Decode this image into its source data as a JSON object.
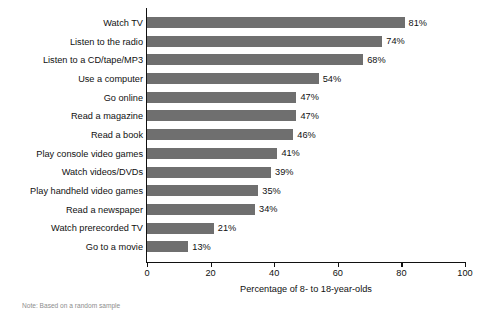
{
  "chart_data": {
    "type": "bar",
    "orientation": "horizontal",
    "title": "",
    "xlabel": "Percentage of 8- to 18-year-olds",
    "ylabel": "",
    "xlim": [
      0,
      100
    ],
    "xticks": [
      0,
      20,
      40,
      60,
      80,
      100
    ],
    "grid": false,
    "legend": null,
    "bar_color": "#6f6f6f",
    "axis_color": "#111111",
    "value_suffix": "%",
    "categories": [
      "Watch TV",
      "Listen to the radio",
      "Listen to a CD/tape/MP3",
      "Use a computer",
      "Go online",
      "Read a magazine",
      "Read a book",
      "Play console video games",
      "Watch videos/DVDs",
      "Play handheld video games",
      "Read a newspaper",
      "Watch prerecorded TV",
      "Go to a movie"
    ],
    "values": [
      81,
      74,
      68,
      54,
      47,
      47,
      46,
      41,
      39,
      35,
      34,
      21,
      13
    ],
    "value_labels": [
      "81%",
      "74%",
      "68%",
      "54%",
      "47%",
      "47%",
      "46%",
      "41%",
      "39%",
      "35%",
      "34%",
      "21%",
      "13%"
    ],
    "xtick_labels": [
      "0",
      "20",
      "40",
      "60",
      "80",
      "100"
    ]
  },
  "footnote": "Note: Based on a random sample"
}
